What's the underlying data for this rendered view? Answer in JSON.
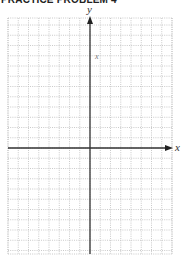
{
  "header": {
    "title": "PRACTICE PROBLEM 4"
  },
  "graph": {
    "type": "blank coordinate grid",
    "x_axis_label": "x",
    "y_axis_label": "y",
    "annotation": "x",
    "grid": {
      "left": 8,
      "top": 18,
      "right": 172,
      "bottom": 254,
      "origin_x": 90,
      "origin_y": 148,
      "cell": 10.25,
      "line_color": "#bdbdbd",
      "line_style": "dotted"
    },
    "axis_color": "#333333"
  }
}
